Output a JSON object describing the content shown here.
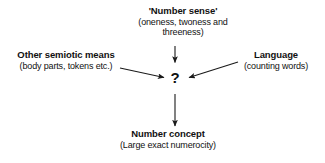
{
  "diagram": {
    "type": "flow-diagram",
    "background_color": "#ffffff",
    "text_color": "#111111",
    "arrow_color": "#1a1a1a",
    "center": {
      "label": "?",
      "name": "question-mark"
    },
    "nodes": [
      {
        "id": "number-sense",
        "title": "'Number sense'",
        "sub_lines": [
          "(oneness, twoness and",
          "threeness)"
        ],
        "position": "top"
      },
      {
        "id": "other-semiotic-means",
        "title": "Other semiotic means",
        "sub_lines": [
          "(body parts, tokens etc.)"
        ],
        "position": "left"
      },
      {
        "id": "language",
        "title": "Language",
        "sub_lines": [
          "(counting words)"
        ],
        "position": "right"
      },
      {
        "id": "number-concept",
        "title": "Number concept",
        "sub_lines": [
          "(Large exact numerocity)"
        ],
        "position": "bottom"
      }
    ],
    "arrows": [
      {
        "id": "arrow-number-sense-to-center",
        "from": "number-sense",
        "to": "question-mark",
        "direction": "down"
      },
      {
        "id": "arrow-other-semiotic-to-center",
        "from": "other-semiotic-means",
        "to": "question-mark",
        "direction": "right-down"
      },
      {
        "id": "arrow-language-to-center",
        "from": "language",
        "to": "question-mark",
        "direction": "left-down"
      },
      {
        "id": "arrow-center-to-number-concept",
        "from": "question-mark",
        "to": "number-concept",
        "direction": "down"
      }
    ]
  }
}
